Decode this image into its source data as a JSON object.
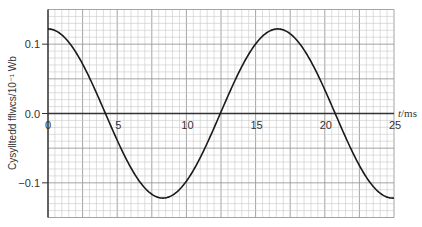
{
  "chart_data": {
    "type": "line",
    "title": "",
    "xlabel": "t/ms",
    "xlabel_italic_part": "t",
    "xlabel_unit_part": "/ms",
    "ylabel": "Cysylltedd fflwcs/10⁻¹ Wb",
    "xlim": [
      0,
      25
    ],
    "ylim": [
      -0.15,
      0.15
    ],
    "x_ticks": [
      0,
      5,
      10,
      15,
      20,
      25
    ],
    "x_tick_labels": [
      "0",
      "5",
      "10",
      "15",
      "20",
      "25"
    ],
    "y_ticks": [
      0.1,
      0.0,
      -0.1
    ],
    "y_tick_labels": [
      "0.1",
      "0.0",
      "−0.1"
    ],
    "grid": true,
    "grid_minor_x_step": 0.5,
    "grid_minor_y_step": 0.01,
    "grid_major_every": 5,
    "legend": null,
    "series": [
      {
        "name": "flux linkage",
        "function": "0.122*cos(2*pi*t/16.6)",
        "amplitude": 0.122,
        "period_ms": 16.6,
        "color": "#1a1a1a",
        "x": [
          0,
          1,
          2,
          3,
          4,
          5,
          6,
          7,
          8,
          8.3,
          9,
          10,
          11,
          12,
          13,
          14,
          15,
          16,
          16.6,
          17,
          18,
          19,
          20,
          21,
          22,
          23,
          24,
          25
        ],
        "y": [
          0.122,
          0.113,
          0.089,
          0.052,
          0.008,
          -0.037,
          -0.077,
          -0.107,
          -0.121,
          -0.122,
          -0.119,
          -0.099,
          -0.065,
          -0.022,
          0.023,
          0.066,
          0.1,
          0.121,
          0.122,
          0.121,
          0.105,
          0.072,
          0.029,
          -0.017,
          -0.058,
          -0.096,
          -0.118,
          -0.122
        ]
      }
    ],
    "annotations": []
  },
  "colors": {
    "curve": "#1a1a1a",
    "axis": "#333333",
    "grid_minor": "#c8c8c8",
    "grid_major": "#9a9a9a",
    "background": "#ffffff"
  }
}
